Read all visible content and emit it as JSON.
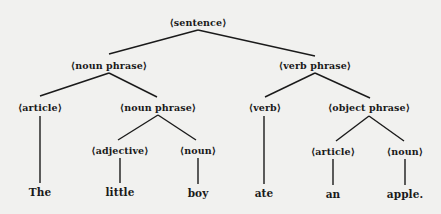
{
  "diagram": {
    "type": "parse-tree",
    "background": "#f1f1ef",
    "ink": "#1a1a1a",
    "nodes": {
      "sentence": {
        "label": "⟨sentence⟩",
        "x": 198,
        "y": 22
      },
      "noun_phrase": {
        "label": "⟨noun phrase⟩",
        "x": 109,
        "y": 65
      },
      "verb_phrase": {
        "label": "⟨verb phrase⟩",
        "x": 315,
        "y": 65
      },
      "article_1": {
        "label": "⟨article⟩",
        "x": 40,
        "y": 107
      },
      "noun_phrase_2": {
        "label": "⟨noun phrase⟩",
        "x": 158,
        "y": 107
      },
      "verb": {
        "label": "⟨verb⟩",
        "x": 265,
        "y": 107
      },
      "object_phrase": {
        "label": "⟨object phrase⟩",
        "x": 369,
        "y": 107
      },
      "adjective": {
        "label": "⟨adjective⟩",
        "x": 120,
        "y": 150
      },
      "noun_1": {
        "label": "⟨noun⟩",
        "x": 198,
        "y": 150
      },
      "article_2": {
        "label": "⟨article⟩",
        "x": 333,
        "y": 151
      },
      "noun_2": {
        "label": "⟨noun⟩",
        "x": 405,
        "y": 151
      }
    },
    "words": {
      "w1": {
        "text": "The",
        "x": 40,
        "y": 192
      },
      "w2": {
        "text": "little",
        "x": 120,
        "y": 192
      },
      "w3": {
        "text": "boy",
        "x": 198,
        "y": 193
      },
      "w4": {
        "text": "ate",
        "x": 264,
        "y": 193
      },
      "w5": {
        "text": "an",
        "x": 333,
        "y": 194
      },
      "w6": {
        "text": "apple.",
        "x": 405,
        "y": 194
      }
    },
    "edges": [
      [
        "sentence",
        "noun_phrase"
      ],
      [
        "sentence",
        "verb_phrase"
      ],
      [
        "noun_phrase",
        "article_1"
      ],
      [
        "noun_phrase",
        "noun_phrase_2"
      ],
      [
        "verb_phrase",
        "verb"
      ],
      [
        "verb_phrase",
        "object_phrase"
      ],
      [
        "noun_phrase_2",
        "adjective"
      ],
      [
        "noun_phrase_2",
        "noun_1"
      ],
      [
        "object_phrase",
        "article_2"
      ],
      [
        "object_phrase",
        "noun_2"
      ],
      [
        "article_1",
        "w1"
      ],
      [
        "adjective",
        "w2"
      ],
      [
        "noun_1",
        "w3"
      ],
      [
        "verb",
        "w4"
      ],
      [
        "article_2",
        "w5"
      ],
      [
        "noun_2",
        "w6"
      ]
    ]
  }
}
